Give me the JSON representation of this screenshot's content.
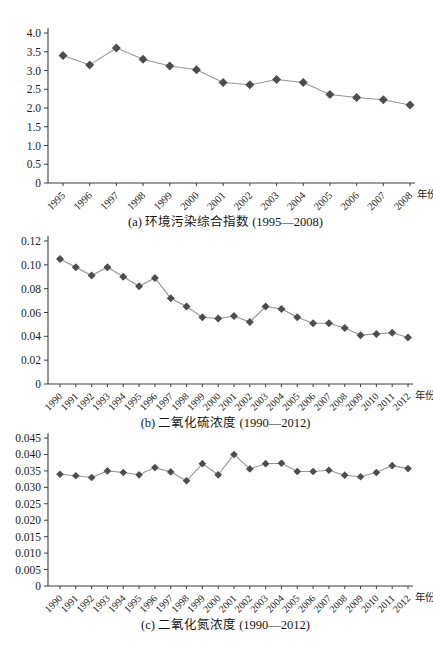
{
  "colors": {
    "background": "#ffffff",
    "axis": "#3d3d3d",
    "line": "#969696",
    "marker": "#4d4d50",
    "text": "#1c1c1c"
  },
  "xlabel_suffix": "年份",
  "chart_data": [
    {
      "type": "line",
      "title": "(a) 环境污染综合指数 (1995—2008)",
      "xlabel": "年份",
      "ylabel": "",
      "legend": "none",
      "grid": false,
      "marker": "diamond",
      "categories": [
        "1995",
        "1996",
        "1997",
        "1998",
        "1999",
        "2000",
        "2001",
        "2002",
        "2003",
        "2004",
        "2005",
        "2006",
        "2007",
        "2008"
      ],
      "values": [
        3.4,
        3.15,
        3.6,
        3.3,
        3.12,
        3.02,
        2.68,
        2.62,
        2.76,
        2.68,
        2.36,
        2.28,
        2.22,
        2.08
      ],
      "ylim": [
        0,
        4.0
      ],
      "ytick_labels": [
        "4.0",
        "3.5",
        "3.0",
        "2.5",
        "2.0",
        "1.5",
        "1.0",
        "0.5",
        "0"
      ]
    },
    {
      "type": "line",
      "title": "(b) 二氧化硫浓度 (1990—2012)",
      "xlabel": "年份",
      "ylabel": "",
      "legend": "none",
      "grid": false,
      "marker": "diamond",
      "categories": [
        "1990",
        "1991",
        "1992",
        "1993",
        "1994",
        "1995",
        "1996",
        "1997",
        "1998",
        "1999",
        "2000",
        "2001",
        "2002",
        "2003",
        "2004",
        "2005",
        "2006",
        "2007",
        "2008",
        "2009",
        "2010",
        "2011",
        "2012"
      ],
      "values": [
        0.105,
        0.098,
        0.091,
        0.098,
        0.09,
        0.082,
        0.089,
        0.072,
        0.065,
        0.056,
        0.055,
        0.057,
        0.052,
        0.065,
        0.063,
        0.056,
        0.051,
        0.051,
        0.047,
        0.041,
        0.042,
        0.043,
        0.039
      ],
      "ylim": [
        0,
        0.12
      ],
      "ytick_labels": [
        "0.12",
        "0.10",
        "0.08",
        "0.06",
        "0.04",
        "0.02",
        "0"
      ]
    },
    {
      "type": "line",
      "title": "(c) 二氧化氮浓度 (1990—2012)",
      "xlabel": "年份",
      "ylabel": "",
      "legend": "none",
      "grid": false,
      "marker": "diamond",
      "categories": [
        "1990",
        "1991",
        "1992",
        "1993",
        "1994",
        "1995",
        "1996",
        "1997",
        "1998",
        "1999",
        "2000",
        "2001",
        "2002",
        "2003",
        "2004",
        "2005",
        "2006",
        "2007",
        "2008",
        "2009",
        "2010",
        "2011",
        "2012"
      ],
      "values": [
        0.034,
        0.0335,
        0.033,
        0.035,
        0.0345,
        0.0338,
        0.036,
        0.0347,
        0.032,
        0.0372,
        0.0338,
        0.04,
        0.0356,
        0.0372,
        0.0373,
        0.0348,
        0.0348,
        0.0352,
        0.0337,
        0.0332,
        0.0345,
        0.0366,
        0.0357
      ],
      "ylim": [
        0,
        0.045
      ],
      "ytick_labels": [
        "0.045",
        "0.040",
        "0.035",
        "0.030",
        "0.025",
        "0.020",
        "0.015",
        "0.010",
        "0.005",
        "0"
      ]
    }
  ]
}
